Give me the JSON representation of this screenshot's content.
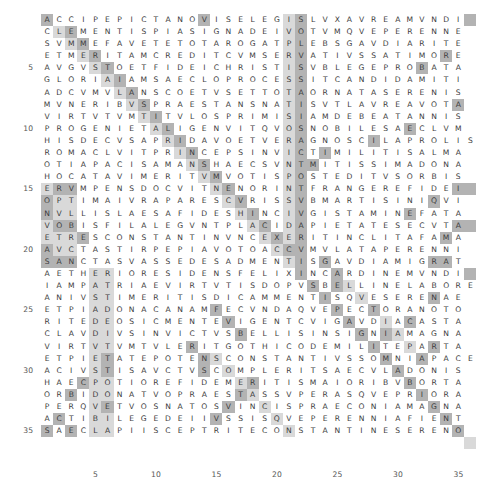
{
  "figure": {
    "type": "letter-grid-heatmap",
    "rows": 36,
    "cols": 36,
    "row_tick_labels": [
      "5",
      "10",
      "15",
      "20",
      "25",
      "30",
      "35"
    ],
    "row_tick_values": [
      5,
      10,
      15,
      20,
      25,
      30,
      35
    ],
    "col_tick_labels": [
      "5",
      "10",
      "15",
      "20",
      "25",
      "30",
      "35"
    ],
    "col_tick_values": [
      5,
      10,
      15,
      20,
      25,
      30,
      35
    ],
    "colors": {
      "background": "#ffffff",
      "text": "#3c3c3c",
      "highlight_light": "#d9d9d9",
      "highlight_dark": "#b3b3b3",
      "tick_label": "#555555"
    }
  },
  "chart_data": {
    "type": "heatmap",
    "title": "",
    "xlabel": "",
    "ylabel": "",
    "xlim": [
      1,
      36
    ],
    "ylim": [
      1,
      36
    ],
    "grid": false,
    "legend": "none",
    "categories": [
      "1",
      "2",
      "3",
      "4",
      "5",
      "6",
      "7",
      "8",
      "9",
      "10",
      "11",
      "12",
      "13",
      "14",
      "15",
      "16",
      "17",
      "18",
      "19",
      "20",
      "21",
      "22",
      "23",
      "24",
      "25",
      "26",
      "27",
      "28",
      "29",
      "30",
      "31",
      "32",
      "33",
      "34",
      "35",
      "36"
    ],
    "letters": [
      "ACCIPEPICTANOVISELEGISLVXAVREAMVNDI",
      "CLEMENTISPIASIGNADEIVOTVMQVEPERENNE",
      "SVMMEFAVETETOTAROGATPLEBSGAVDIARITE",
      "ETMERITAMCREDITCVMSERVATIVSSATIMORE",
      "AVGVSTOETFIDEICHRISTISVBLEGEPROBATA",
      "GLORIAIAMSAECLOPROCESSITCANDIDAMITI",
      "ADCVMVLANSCOETVSETTOTAORNATASERENIS",
      "MVNERIBVSPRAESTANSNATISVTLAVREAVOTA",
      "VIRTVTVMTITVLOSPRIMISIAMDEBEATANNIS",
      "PROGENIETALIGENVITQVOSNOBILESAECLVM",
      "HISDECVSAPRIDAVOETVERAGNOSCILAPROLIS",
      "ROMACLVITPRINCEPSINVICTIMILITISALMA",
      "OTIAPACISAMANSHAECSVNTMITISSIMADONA",
      "HOCATAVIMERITVMVOTISPOSTEDITVSORBIS",
      "ERVMPENSDOCVITNENORINTFRANGEREFIDEI",
      "OPTIMAIVRAPARESCVRISSVBMARTISINIQVI",
      "NVLLISLAESAFIDESHINCIVGISTAMINEFATA",
      "VOBISFILALEGVNTPLACIDAPIETATESECVTA",
      "ETRESCONSTANTINVNCEXERITINCLITAFAMA",
      "AVCTASTIRPEPIAVOTOACCVMVLATAPERENNI",
      "SANCTASVASSEDESADMENTISGAVDIAMIGRAT",
      "AETHERIORESIDENSFELIXINCARDINEMVNDI",
      "IAMPATRIAEVIRTVTISDOPVSBELLINELABORE",
      "ANIVSTIMERITISDICAMMENTISQVESERENAE",
      "ETPIADONACANAMFECVNDAQVEPECTORANOTO",
      "RITEDEOSICMENTEVIGENTCVIGAVDIACASTA",
      "CLAVDIVSINVICTVSBELLISINSIGNIAMAGNA",
      "VIRTVTVMTVLERITGOTHICODEMILITEPARTA",
      "ETPIETATEPOTENSCONSTANTIVSSOMNIAPACE",
      "ACIVSTISAVCTVSCOMPLERITSAECVLADONIS",
      "HAECPOTIOREFIDEMERITISMAIORIBVBORTA",
      "ORBIDONATVOPRAESTASSVPERASQVEPRIORA",
      "PERQVETVOSNATOSVINCISPRAECONIAMAGNA",
      "ACTIBILEGEDEIIVSSISQVEPERENNIAFIENT",
      "SAECLAPIISCEPTRITECONSTANTINESERENO"
    ],
    "highlight_dark_cells": [
      [
        1,
        1
      ],
      [
        1,
        14
      ],
      [
        1,
        22
      ],
      [
        1,
        36
      ],
      [
        2,
        3
      ],
      [
        2,
        22
      ],
      [
        3,
        4
      ],
      [
        3,
        22
      ],
      [
        4,
        5
      ],
      [
        4,
        22
      ],
      [
        4,
        34
      ],
      [
        5,
        6
      ],
      [
        5,
        22
      ],
      [
        5,
        32
      ],
      [
        6,
        7
      ],
      [
        6,
        22
      ],
      [
        7,
        8
      ],
      [
        7,
        22
      ],
      [
        8,
        9
      ],
      [
        8,
        22
      ],
      [
        8,
        35
      ],
      [
        9,
        10
      ],
      [
        9,
        22
      ],
      [
        10,
        11
      ],
      [
        10,
        22
      ],
      [
        10,
        31
      ],
      [
        11,
        12
      ],
      [
        11,
        22
      ],
      [
        11,
        28
      ],
      [
        12,
        13
      ],
      [
        12,
        22
      ],
      [
        12,
        24
      ],
      [
        13,
        14
      ],
      [
        13,
        22
      ],
      [
        13,
        23
      ],
      [
        14,
        15
      ],
      [
        14,
        22
      ],
      [
        15,
        2
      ],
      [
        15,
        3
      ],
      [
        15,
        16
      ],
      [
        15,
        22
      ],
      [
        15,
        35
      ],
      [
        15,
        36
      ],
      [
        16,
        1
      ],
      [
        16,
        17
      ],
      [
        16,
        22
      ],
      [
        16,
        33
      ],
      [
        17,
        1
      ],
      [
        17,
        18
      ],
      [
        17,
        22
      ],
      [
        17,
        31
      ],
      [
        18,
        2
      ],
      [
        18,
        3
      ],
      [
        18,
        19
      ],
      [
        18,
        22
      ],
      [
        18,
        35
      ],
      [
        18,
        36
      ],
      [
        19,
        4
      ],
      [
        19,
        20
      ],
      [
        19,
        22
      ],
      [
        19,
        34
      ],
      [
        20,
        1
      ],
      [
        20,
        21
      ],
      [
        20,
        22
      ],
      [
        21,
        1
      ],
      [
        21,
        2
      ],
      [
        21,
        3
      ],
      [
        21,
        22
      ],
      [
        21,
        24
      ],
      [
        21,
        33
      ],
      [
        21,
        34
      ],
      [
        22,
        22
      ],
      [
        22,
        25
      ],
      [
        22,
        36
      ],
      [
        23,
        23
      ],
      [
        23,
        25
      ],
      [
        24,
        24
      ],
      [
        24,
        33
      ],
      [
        25,
        15
      ],
      [
        25,
        25
      ],
      [
        25,
        28
      ],
      [
        26,
        16
      ],
      [
        26,
        26
      ],
      [
        26,
        31
      ],
      [
        27,
        17
      ],
      [
        27,
        27
      ],
      [
        27,
        29
      ],
      [
        28,
        13
      ],
      [
        28,
        28
      ],
      [
        28,
        33
      ],
      [
        29,
        6
      ],
      [
        29,
        14
      ],
      [
        29,
        29
      ],
      [
        29,
        32
      ],
      [
        30,
        6
      ],
      [
        30,
        14
      ],
      [
        30,
        30
      ],
      [
        31,
        4
      ],
      [
        31,
        18
      ],
      [
        31,
        31
      ],
      [
        32,
        3
      ],
      [
        32,
        17
      ],
      [
        32,
        32
      ],
      [
        33,
        6
      ],
      [
        33,
        16
      ],
      [
        33,
        33
      ],
      [
        34,
        2
      ],
      [
        34,
        15
      ],
      [
        34,
        34
      ],
      [
        35,
        1
      ],
      [
        35,
        3
      ],
      [
        35,
        35
      ]
    ]
  },
  "grid_letters_note": "36 characters per row"
}
